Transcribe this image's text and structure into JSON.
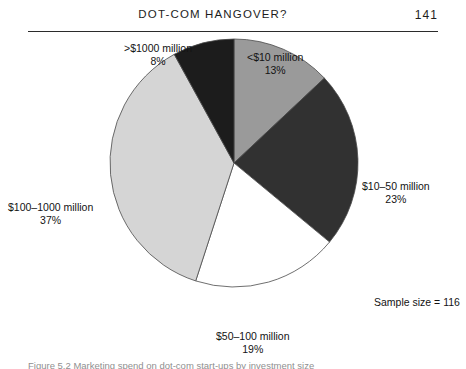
{
  "header": {
    "title": "DOT-COM HANGOVER?",
    "page_number": "141",
    "rule_color": "#2b2b2b"
  },
  "figure": {
    "sample_size_note": "Sample size = 116",
    "caption": "Figure 5.2  Marketing spend on dot-com start-ups by investment size",
    "caption_color": "#8f8f8f"
  },
  "chart_data": {
    "type": "pie",
    "title": "",
    "subtitle": "",
    "xlabel": "",
    "ylabel": "",
    "legend_position": "callout-labels",
    "grid": false,
    "sample_size": 116,
    "start_angle_deg": 0,
    "direction": "clockwise",
    "categories": [
      "<$10 million",
      "$10–50 million",
      "$50–100 million",
      "$100–1000 million",
      ">$1000 million"
    ],
    "values": [
      13,
      23,
      19,
      37,
      8
    ],
    "value_labels": [
      "13%",
      "23%",
      "19%",
      "37%",
      "8%"
    ],
    "colors": [
      "#9a9a9a",
      "#313131",
      "#ffffff",
      "#d5d5d5",
      "#1c1c1c"
    ],
    "slice_outline_color": "#4a4a4a",
    "slices": [
      {
        "label": "<$10 million",
        "percent": 13,
        "percent_label": "13%",
        "color": "#9a9a9a",
        "start_deg": 0,
        "end_deg": 46.8
      },
      {
        "label": "$10–50 million",
        "percent": 23,
        "percent_label": "23%",
        "color": "#313131",
        "start_deg": 46.8,
        "end_deg": 129.6
      },
      {
        "label": "$50–100 million",
        "percent": 19,
        "percent_label": "19%",
        "color": "#ffffff",
        "start_deg": 129.6,
        "end_deg": 198.0
      },
      {
        "label": "$100–1000 million",
        "percent": 37,
        "percent_label": "37%",
        "color": "#d5d5d5",
        "start_deg": 198.0,
        "end_deg": 331.2
      },
      {
        "label": ">$1000 million",
        "percent": 8,
        "percent_label": "8%",
        "color": "#1c1c1c",
        "start_deg": 331.2,
        "end_deg": 360.0
      }
    ]
  }
}
